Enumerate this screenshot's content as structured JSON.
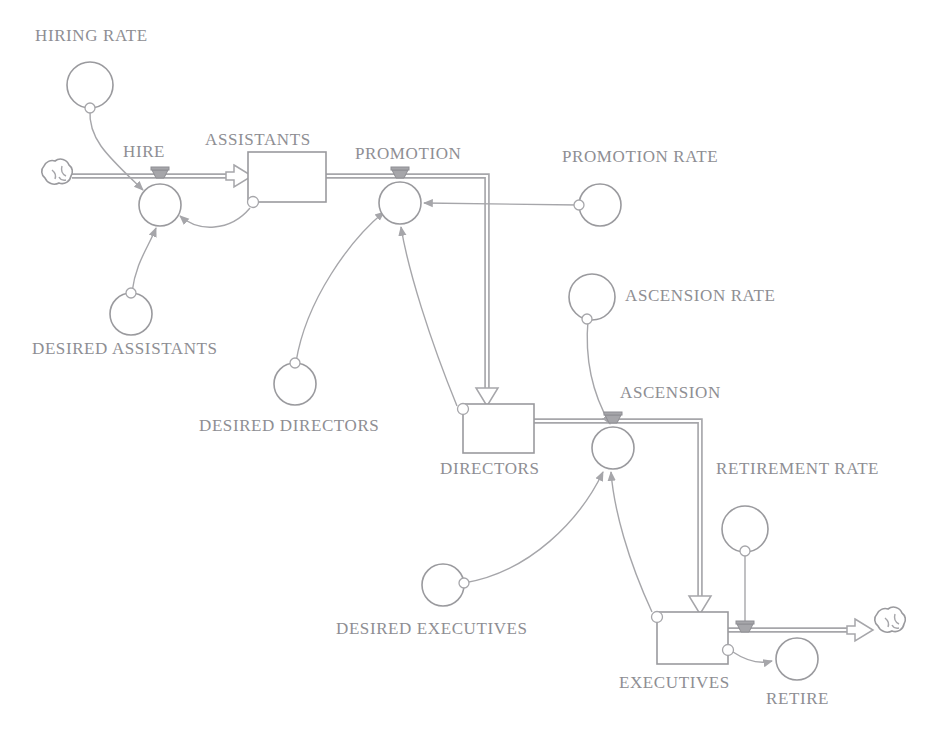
{
  "diagram": {
    "type": "system-dynamics-stock-and-flow",
    "colors": {
      "stroke": "#9a9a9e",
      "pipe": "#a6a6aa",
      "label": "#8e8e93",
      "background": "#ffffff"
    },
    "stocks": [
      {
        "id": "assistants",
        "label": "ASSISTANTS",
        "x": 248,
        "y": 152,
        "w": 78,
        "h": 50,
        "label_x": 205,
        "label_y": 141
      },
      {
        "id": "directors",
        "label": "DIRECTORS",
        "x": 463,
        "y": 404,
        "w": 71,
        "h": 49,
        "label_x": 440,
        "label_y": 470
      },
      {
        "id": "executives",
        "label": "EXECUTIVES",
        "x": 657,
        "y": 612,
        "w": 71,
        "h": 52,
        "label_x": 619,
        "label_y": 684
      }
    ],
    "flows": [
      {
        "id": "hire",
        "label": "HIRE",
        "cx": 160,
        "cy": 205,
        "r": 21,
        "label_x": 123,
        "label_y": 153
      },
      {
        "id": "promotion",
        "label": "PROMOTION",
        "cx": 400,
        "cy": 203,
        "r": 21,
        "label_x": 355,
        "label_y": 155
      },
      {
        "id": "ascension",
        "label": "ASCENSION",
        "cx": 613,
        "cy": 448,
        "r": 21,
        "label_x": 620,
        "label_y": 394
      },
      {
        "id": "retire",
        "label": "RETIRE",
        "cx": 797,
        "cy": 659,
        "r": 21,
        "label_x": 766,
        "label_y": 700
      }
    ],
    "converters": [
      {
        "id": "hiring-rate",
        "label": "HIRING RATE",
        "cx": 90,
        "cy": 85,
        "r": 23,
        "label_x": 35,
        "label_y": 37
      },
      {
        "id": "desired-assistants",
        "label": "DESIRED ASSISTANTS",
        "cx": 131,
        "cy": 314,
        "r": 21,
        "label_x": 32,
        "label_y": 350
      },
      {
        "id": "desired-directors",
        "label": "DESIRED DIRECTORS",
        "cx": 295,
        "cy": 384,
        "r": 21,
        "label_x": 199,
        "label_y": 427
      },
      {
        "id": "promotion-rate",
        "label": "PROMOTION RATE",
        "cx": 600,
        "cy": 205,
        "r": 21,
        "label_x": 562,
        "label_y": 158
      },
      {
        "id": "ascension-rate",
        "label": "ASCENSION RATE",
        "cx": 592,
        "cy": 297,
        "r": 23,
        "label_x": 625,
        "label_y": 297
      },
      {
        "id": "desired-executives",
        "label": "DESIRED EXECUTIVES",
        "cx": 443,
        "cy": 585,
        "r": 21,
        "label_x": 336,
        "label_y": 630
      },
      {
        "id": "retirement-rate",
        "label": "RETIREMENT RATE",
        "cx": 745,
        "cy": 529,
        "r": 23,
        "label_x": 716,
        "label_y": 470
      }
    ],
    "clouds": [
      {
        "id": "source-cloud",
        "cx": 55,
        "cy": 176
      },
      {
        "id": "sink-cloud",
        "cx": 888,
        "cy": 624
      }
    ],
    "connections": [
      {
        "from": "hiring-rate",
        "to": "hire"
      },
      {
        "from": "assistants",
        "to": "hire"
      },
      {
        "from": "desired-assistants",
        "to": "hire"
      },
      {
        "from": "desired-directors",
        "to": "promotion"
      },
      {
        "from": "directors",
        "to": "promotion"
      },
      {
        "from": "promotion-rate",
        "to": "promotion"
      },
      {
        "from": "ascension-rate",
        "to": "ascension"
      },
      {
        "from": "desired-executives",
        "to": "ascension"
      },
      {
        "from": "executives",
        "to": "ascension"
      },
      {
        "from": "retirement-rate",
        "to": "retire"
      },
      {
        "from": "executives",
        "to": "retire"
      }
    ]
  }
}
